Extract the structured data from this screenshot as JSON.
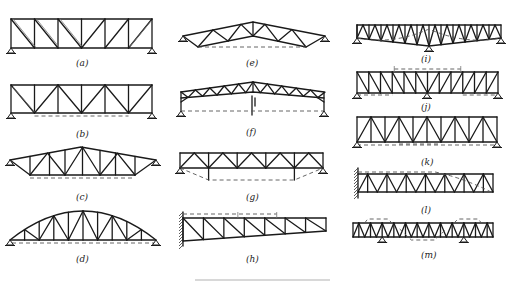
{
  "figure": {
    "type": "truss-diagram-collection",
    "panels": [
      {
        "id": "a",
        "label": "(a)",
        "description": "Parallel-chord truss, simply supported, diagonals in single direction per half"
      },
      {
        "id": "b",
        "label": "(b)",
        "description": "Parallel-chord Warren truss with verticals, dashed deflection line"
      },
      {
        "id": "c",
        "label": "(c)",
        "description": "Triangular (pitched) truss with verticals, dashed bottom line"
      },
      {
        "id": "d",
        "label": "(d)",
        "description": "Arched (bow-string) truss with verticals"
      },
      {
        "id": "e",
        "label": "(e)",
        "description": "Pitched truss with raised bottom chord"
      },
      {
        "id": "f",
        "label": "(f)",
        "description": "Three-hinged pitched truss with center hinge"
      },
      {
        "id": "g",
        "label": "(g)",
        "description": "Parallel-chord truss with dashed trapezoidal tie"
      },
      {
        "id": "h",
        "label": "(h)",
        "description": "Cantilever truss fixed to wall, tapered"
      },
      {
        "id": "i",
        "label": "(i)",
        "description": "Two-span continuous truss with center support"
      },
      {
        "id": "j",
        "label": "(j)",
        "description": "Continuous truss over three supports"
      },
      {
        "id": "k",
        "label": "(k)",
        "description": "Parallel-chord Warren truss with verticals"
      },
      {
        "id": "l",
        "label": "(l)",
        "description": "Cantilever parallel-chord truss fixed to wall"
      },
      {
        "id": "m",
        "label": "(m)",
        "description": "Truss with overhangs on two interior supports"
      }
    ]
  }
}
